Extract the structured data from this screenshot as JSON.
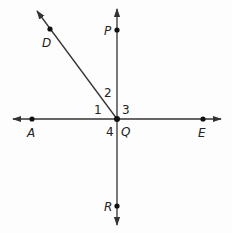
{
  "diagram": {
    "type": "intersecting-lines",
    "colors": {
      "line": "#333333",
      "point": "#111111",
      "text": "#222222",
      "background": "#fdfdfd"
    },
    "intersection": {
      "label": "Q",
      "x": 117,
      "y": 119
    },
    "points": {
      "D": {
        "label": "D",
        "x": 50,
        "y": 29
      },
      "P": {
        "label": "P",
        "x": 117,
        "y": 30
      },
      "A": {
        "label": "A",
        "x": 32,
        "y": 119
      },
      "E": {
        "label": "E",
        "x": 203,
        "y": 119
      },
      "R": {
        "label": "R",
        "x": 117,
        "y": 206
      },
      "Q": {
        "label": "Q",
        "x": 117,
        "y": 119
      }
    },
    "angles": {
      "a1": {
        "label": "1"
      },
      "a2": {
        "label": "2"
      },
      "a3": {
        "label": "3"
      },
      "a4": {
        "label": "4"
      }
    },
    "lines": [
      {
        "name": "line AE (horizontal)",
        "through": [
          "A",
          "Q",
          "E"
        ],
        "arrows": "both"
      },
      {
        "name": "line PR (vertical)",
        "through": [
          "P",
          "Q",
          "R"
        ],
        "arrows": "both"
      },
      {
        "name": "ray QD",
        "through": [
          "Q",
          "D"
        ],
        "arrows": "end"
      }
    ]
  }
}
